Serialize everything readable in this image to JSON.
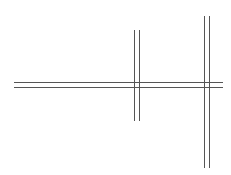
{
  "diagram": {
    "background": "#ffffff",
    "stroke_color": "#555555",
    "stroke_width": 1,
    "double_lines": [
      {
        "name": "horizontal-double-line",
        "orientation": "horizontal",
        "start": 14,
        "end": 223,
        "offsets": [
          82,
          87
        ]
      },
      {
        "name": "middle-vertical-double-line",
        "orientation": "vertical",
        "start": 30,
        "end": 121,
        "offsets": [
          134,
          139
        ]
      },
      {
        "name": "right-vertical-double-line",
        "orientation": "vertical",
        "start": 16,
        "end": 168,
        "offsets": [
          204,
          209
        ]
      }
    ]
  }
}
